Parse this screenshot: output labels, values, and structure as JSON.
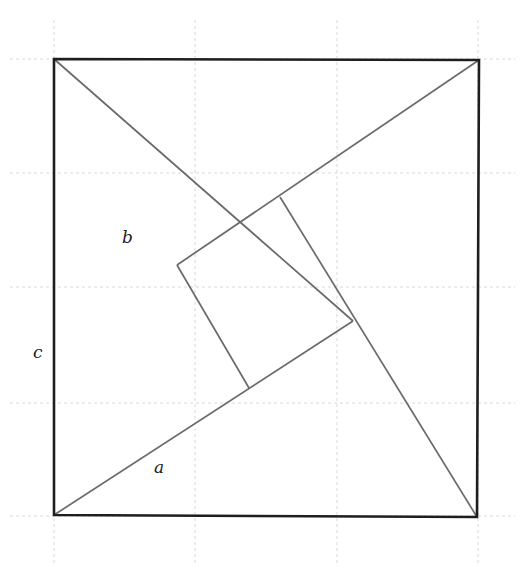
{
  "diagram": {
    "labels": {
      "a": "a",
      "b": "b",
      "c": "c"
    },
    "colors": {
      "outer_square": "#1e1e1e",
      "inner_lines": "#6a6a6a",
      "grid": "#d8d8d8",
      "background": "#ffffff"
    },
    "outer_square": {
      "corners": [
        [
          54,
          59
        ],
        [
          479,
          60
        ],
        [
          477,
          517
        ],
        [
          54,
          515
        ]
      ]
    },
    "inner_square": {
      "vertices": [
        [
          177,
          265
        ],
        [
          280,
          197
        ],
        [
          353,
          321
        ],
        [
          249,
          388
        ]
      ]
    },
    "triangles": [
      {
        "name": "left-triangle",
        "points": [
          [
            54,
            59
          ],
          [
            177,
            265
          ],
          [
            54,
            515
          ]
        ]
      },
      {
        "name": "top-triangle",
        "points": [
          [
            54,
            59
          ],
          [
            479,
            60
          ],
          [
            280,
            197
          ]
        ]
      },
      {
        "name": "right-triangle",
        "points": [
          [
            479,
            60
          ],
          [
            477,
            517
          ],
          [
            353,
            321
          ]
        ]
      },
      {
        "name": "bottom-triangle",
        "points": [
          [
            54,
            515
          ],
          [
            477,
            517
          ],
          [
            249,
            388
          ]
        ]
      }
    ],
    "grid": {
      "vertical_x": [
        54,
        195,
        337,
        478
      ],
      "horizontal_y": [
        59,
        173,
        287,
        403,
        516
      ]
    }
  }
}
